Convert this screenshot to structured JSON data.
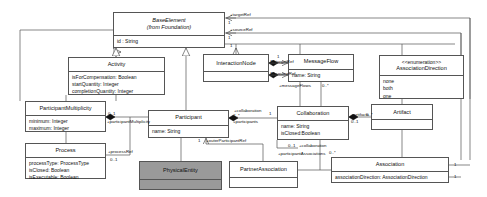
{
  "diagram": {
    "type": "uml-class-diagram",
    "background": "#ffffff",
    "line_color": "#555555",
    "shaded_fill": "#9a9a9a"
  },
  "classes": [
    {
      "id": "baseElement",
      "name": "BaseElement",
      "sub": "(from Foundation)",
      "italic": true,
      "x": 113,
      "y": 12,
      "w": 112,
      "h": 36,
      "attributes": [
        "id : String"
      ],
      "shaded": false
    },
    {
      "id": "activity",
      "name": "Activity",
      "x": 68,
      "y": 57,
      "w": 97,
      "h": 38,
      "attributes": [
        "isForCompensation: Boolean",
        "startQuantity: Integer",
        "completionQuantity: Integer"
      ],
      "shaded": false
    },
    {
      "id": "interactionNode",
      "name": "InteractionNode",
      "x": 203,
      "y": 54,
      "w": 66,
      "h": 28,
      "attributes": [],
      "shaded": false
    },
    {
      "id": "messageFlow",
      "name": "MessageFlow",
      "x": 288,
      "y": 54,
      "w": 66,
      "h": 28,
      "attributes": [
        "name: String"
      ],
      "shaded": false
    },
    {
      "id": "associationDirection",
      "name": "AssociationDirection",
      "stereotype": "<<enumeration>>",
      "x": 379,
      "y": 55,
      "w": 85,
      "h": 44,
      "attributes": [
        "none",
        "both",
        "one"
      ],
      "shaded": false
    },
    {
      "id": "participantMultiplicity",
      "name": "ParticipantMultiplicity",
      "x": 25,
      "y": 101,
      "w": 81,
      "h": 31,
      "attributes": [
        "minimum: Integer",
        "maximum: Integer"
      ],
      "shaded": false
    },
    {
      "id": "process",
      "name": "Process",
      "x": 25,
      "y": 143,
      "w": 81,
      "h": 36,
      "attributes": [
        "processType: ProcessType",
        "isClosed: Boolean",
        "isExecutable: Boolean"
      ],
      "shaded": false
    },
    {
      "id": "participant",
      "name": "Participant",
      "x": 148,
      "y": 110,
      "w": 81,
      "h": 28,
      "attributes": [
        "name: String"
      ],
      "shaded": false
    },
    {
      "id": "collaboration",
      "name": "Collaboration",
      "x": 277,
      "y": 106,
      "w": 72,
      "h": 34,
      "attributes": [
        "name: String",
        "isClosed:Boolean"
      ],
      "shaded": false
    },
    {
      "id": "artifact",
      "name": "Artifact",
      "x": 371,
      "y": 104,
      "w": 62,
      "h": 26,
      "attributes": [],
      "shaded": false
    },
    {
      "id": "physicalEntity",
      "name": "PhysicalEntity",
      "x": 139,
      "y": 161,
      "w": 83,
      "h": 29,
      "attributes": [],
      "shaded": true
    },
    {
      "id": "partnerAssociation",
      "name": "PartnerAssociation",
      "x": 229,
      "y": 161,
      "w": 69,
      "h": 27,
      "attributes": [],
      "shaded": false
    },
    {
      "id": "association",
      "name": "Association",
      "x": 331,
      "y": 157,
      "w": 118,
      "h": 26,
      "attributes": [
        "associationDirection: AssociationDirection"
      ],
      "shaded": false
    }
  ],
  "edge_labels": [
    {
      "id": "el-targetref-top",
      "text": "+targetRef",
      "x": 230,
      "y": 15
    },
    {
      "id": "el-sourceref-top",
      "text": "+sourceRef",
      "x": 230,
      "y": 30
    },
    {
      "id": "el-targetref-mf",
      "text": "+targetRef",
      "x": 273,
      "y": 62
    },
    {
      "id": "el-sourceref-mf",
      "text": "+sourceRef",
      "x": 273,
      "y": 74
    },
    {
      "id": "el-messageflows",
      "text": "+messageFlows",
      "x": 277,
      "y": 86
    },
    {
      "id": "el-participantmultiplicity",
      "text": "+participantMultiplicity",
      "x": 107,
      "y": 122
    },
    {
      "id": "el-processref",
      "text": "+processRef",
      "x": 108,
      "y": 152
    },
    {
      "id": "el-collaboration-top",
      "text": "+collaboration",
      "x": 237,
      "y": 110
    },
    {
      "id": "el-participants",
      "text": "+participants",
      "x": 235,
      "y": 121
    },
    {
      "id": "el-artifacts",
      "text": "+artifacts",
      "x": 352,
      "y": 115
    },
    {
      "id": "el-outerparticipantref",
      "text": "+outerParticipantRef",
      "x": 206,
      "y": 141
    },
    {
      "id": "el-collaboration-bottom",
      "text": "+collaboration",
      "x": 300,
      "y": 146
    },
    {
      "id": "el-participantassociations",
      "text": "+participantAssociations",
      "x": 282,
      "y": 154
    }
  ],
  "multiplicities": [
    {
      "id": "m-top-1",
      "text": "1",
      "x": 228,
      "y": 22
    },
    {
      "id": "m-top-2",
      "text": "1",
      "x": 228,
      "y": 38
    },
    {
      "id": "m-mf-1",
      "text": "1",
      "x": 276,
      "y": 56
    },
    {
      "id": "m-mf-t",
      "text": "1",
      "x": 269,
      "y": 62
    },
    {
      "id": "m-mf-s",
      "text": "1",
      "x": 269,
      "y": 74
    },
    {
      "id": "m-mf-many",
      "text": "0..*",
      "x": 318,
      "y": 86
    },
    {
      "id": "m-pm",
      "text": "0..1",
      "x": 108,
      "y": 114
    },
    {
      "id": "m-pr",
      "text": "0..1",
      "x": 110,
      "y": 160
    },
    {
      "id": "m-collab-1",
      "text": "1",
      "x": 269,
      "y": 113
    },
    {
      "id": "m-part-many",
      "text": "2..*",
      "x": 233,
      "y": 115
    },
    {
      "id": "m-artifacts",
      "text": "0..1",
      "x": 352,
      "y": 122
    },
    {
      "id": "m-artifacts-star",
      "text": "0..*",
      "x": 366,
      "y": 119
    },
    {
      "id": "m-outer",
      "text": "1",
      "x": 197,
      "y": 141
    },
    {
      "id": "m-collab-b",
      "text": "0..1",
      "x": 288,
      "y": 146
    },
    {
      "id": "m-pa-star",
      "text": "0..*",
      "x": 330,
      "y": 152
    },
    {
      "id": "m-assoc-1",
      "text": "1",
      "x": 455,
      "y": 164
    },
    {
      "id": "m-assoc-2",
      "text": "1",
      "x": 455,
      "y": 176
    },
    {
      "id": "m-bel",
      "text": "1",
      "x": 230,
      "y": 46
    }
  ]
}
